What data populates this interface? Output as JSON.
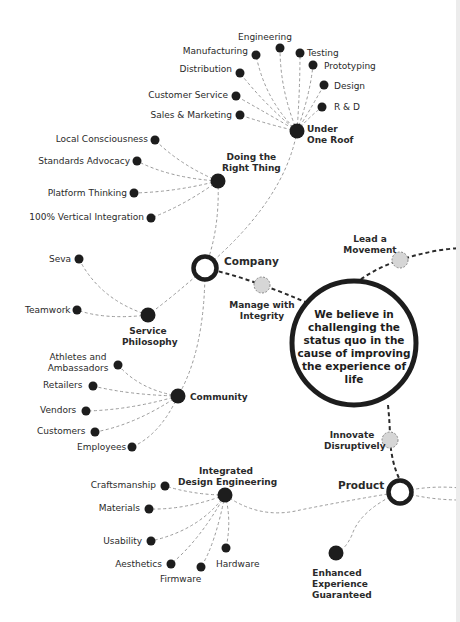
{
  "core": {
    "statement": "We believe in challenging the status quo in the cause of improving the experience of life"
  },
  "pillars": {
    "company": "Company",
    "product": "Product"
  },
  "values": {
    "lead_a_movement": "Lead a\nMovement",
    "manage_with_integrity": "Manage with\nIntegrity",
    "innovate_disruptively": "Innovate\nDisruptively"
  },
  "hubs": {
    "under_one_roof": "Under\nOne Roof",
    "doing_the_right_thing": "Doing the\nRight Thing",
    "service_philosophy": "Service\nPhilosophy",
    "community": "Community",
    "integrated_design_engineering": "Integrated\nDesign Engineering",
    "enhanced_experience": "Enhanced\nExperience\nGuaranteed"
  },
  "under_one_roof_items": [
    "Engineering",
    "Manufacturing",
    "Testing",
    "Prototyping",
    "Distribution",
    "Design",
    "Customer Service",
    "R & D",
    "Sales & Marketing"
  ],
  "doing_right_thing_items": [
    "Local Consciousness",
    "Standards Advocacy",
    "Platform Thinking",
    "100% Vertical Integration"
  ],
  "service_items": [
    "Seva",
    "Teamwork"
  ],
  "community_items": [
    "Athletes and\nAmbassadors",
    "Retailers",
    "Vendors",
    "Customers",
    "Employees"
  ],
  "design_items": [
    "Craftsmanship",
    "Materials",
    "Usability",
    "Aesthetics",
    "Firmware",
    "Hardware"
  ]
}
